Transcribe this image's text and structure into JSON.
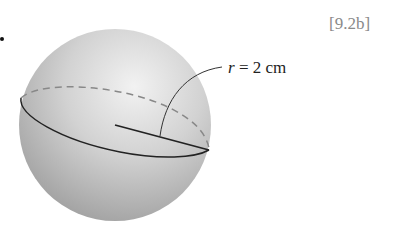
{
  "figure": {
    "reference": "[9.2b]",
    "radius_label": {
      "variable": "r",
      "equals": " = ",
      "value": "2 cm"
    },
    "shape": "sphere",
    "colors": {
      "sphere_light": "#e8e8e8",
      "sphere_dark": "#9a9a9a",
      "line": "#222222",
      "dashed": "#888888"
    }
  }
}
